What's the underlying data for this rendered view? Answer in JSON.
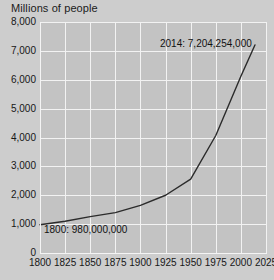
{
  "chart_data": {
    "type": "line",
    "title": "Millions of people",
    "xlabel": "",
    "ylabel": "Millions of people",
    "xlim": [
      1800,
      2025
    ],
    "ylim": [
      0,
      8000
    ],
    "grid": true,
    "legend": "none",
    "x_ticks": [
      "1800",
      "1825",
      "1850",
      "1875",
      "1900",
      "1925",
      "1950",
      "1975",
      "2000",
      "2025"
    ],
    "x_tick_values": [
      1800,
      1825,
      1850,
      1875,
      1900,
      1925,
      1950,
      1975,
      2000,
      2025
    ],
    "y_ticks": [
      "8,000",
      "7,000",
      "6,000",
      "5,000",
      "4,000",
      "3,000",
      "2,000",
      "1,000",
      "0"
    ],
    "y_tick_values": [
      8000,
      7000,
      6000,
      5000,
      4000,
      3000,
      2000,
      1000,
      0
    ],
    "x": [
      1800,
      1825,
      1850,
      1875,
      1900,
      1925,
      1950,
      1975,
      2000,
      2014
    ],
    "values": [
      980,
      1100,
      1260,
      1400,
      1650,
      2000,
      2560,
      4070,
      6120,
      7204
    ],
    "series": [
      {
        "name": "World population",
        "x": [
          1800,
          1825,
          1850,
          1875,
          1900,
          1925,
          1950,
          1975,
          2000,
          2014
        ],
        "values": [
          980,
          1100,
          1260,
          1400,
          1650,
          2000,
          2560,
          4070,
          6120,
          7204
        ]
      }
    ],
    "annotations": [
      {
        "name": "start-point",
        "text": "1800: 980,000,000",
        "x": 1800,
        "y": 980
      },
      {
        "name": "end-point",
        "text": "2014: 7,204,254,000",
        "x": 2014,
        "y": 7204
      }
    ],
    "colors": {
      "line": "#2b2b2b",
      "plot_background": "#c3c3c3",
      "page_background": "#cdcdcd",
      "gridline": "#f2f2f2",
      "text": "#171717"
    }
  },
  "labels": {
    "title": "Millions of people",
    "annotation_start": "1800: 980,000,000",
    "annotation_end": "2014: 7,204,254,000"
  }
}
